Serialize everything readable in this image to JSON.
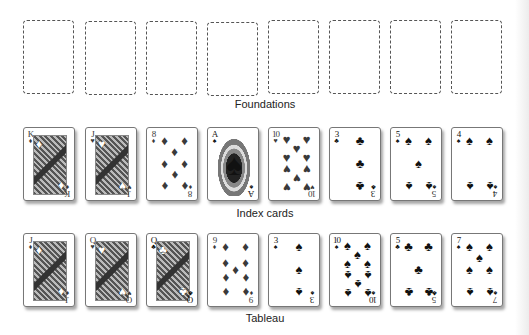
{
  "foundations": {
    "label": "Foundations",
    "slots": [
      {
        "x": 23
      },
      {
        "x": 85
      },
      {
        "x": 146
      },
      {
        "x": 207
      },
      {
        "x": 268
      },
      {
        "x": 329
      },
      {
        "x": 390
      },
      {
        "x": 451
      }
    ]
  },
  "index_cards": {
    "label": "Index cards",
    "cards": [
      {
        "rank": "K",
        "suit": "diamonds",
        "symbol": "♦",
        "color": "red",
        "type": "face"
      },
      {
        "rank": "J",
        "suit": "hearts",
        "symbol": "♥",
        "color": "red",
        "type": "face"
      },
      {
        "rank": "8",
        "suit": "diamonds",
        "symbol": "♦",
        "color": "red",
        "type": "pips"
      },
      {
        "rank": "A",
        "suit": "spades",
        "symbol": "♠",
        "color": "black",
        "type": "ace"
      },
      {
        "rank": "10",
        "suit": "hearts",
        "symbol": "♥",
        "color": "red",
        "type": "pips"
      },
      {
        "rank": "3",
        "suit": "clubs",
        "symbol": "♣",
        "color": "black",
        "type": "pips"
      },
      {
        "rank": "5",
        "suit": "spades",
        "symbol": "♠",
        "color": "black",
        "type": "pips"
      },
      {
        "rank": "4",
        "suit": "spades",
        "symbol": "♠",
        "color": "black",
        "type": "pips"
      }
    ]
  },
  "tableau": {
    "label": "Tableau",
    "cards": [
      {
        "rank": "J",
        "suit": "diamonds",
        "symbol": "♦",
        "color": "red",
        "type": "face"
      },
      {
        "rank": "Q",
        "suit": "hearts",
        "symbol": "♥",
        "color": "red",
        "type": "face"
      },
      {
        "rank": "Q",
        "suit": "clubs",
        "symbol": "♣",
        "color": "black",
        "type": "face"
      },
      {
        "rank": "9",
        "suit": "diamonds",
        "symbol": "♦",
        "color": "red",
        "type": "pips"
      },
      {
        "rank": "3",
        "suit": "spades",
        "symbol": "♠",
        "color": "black",
        "type": "pips"
      },
      {
        "rank": "10",
        "suit": "spades",
        "symbol": "♠",
        "color": "black",
        "type": "pips"
      },
      {
        "rank": "5",
        "suit": "clubs",
        "symbol": "♣",
        "color": "black",
        "type": "pips"
      },
      {
        "rank": "7",
        "suit": "spades",
        "symbol": "♠",
        "color": "black",
        "type": "pips"
      }
    ]
  },
  "layout": {
    "card_x": [
      23,
      85,
      146,
      207,
      268,
      329,
      390,
      451
    ],
    "foundations_y": 20,
    "index_y": 127,
    "tableau_y": 233
  }
}
